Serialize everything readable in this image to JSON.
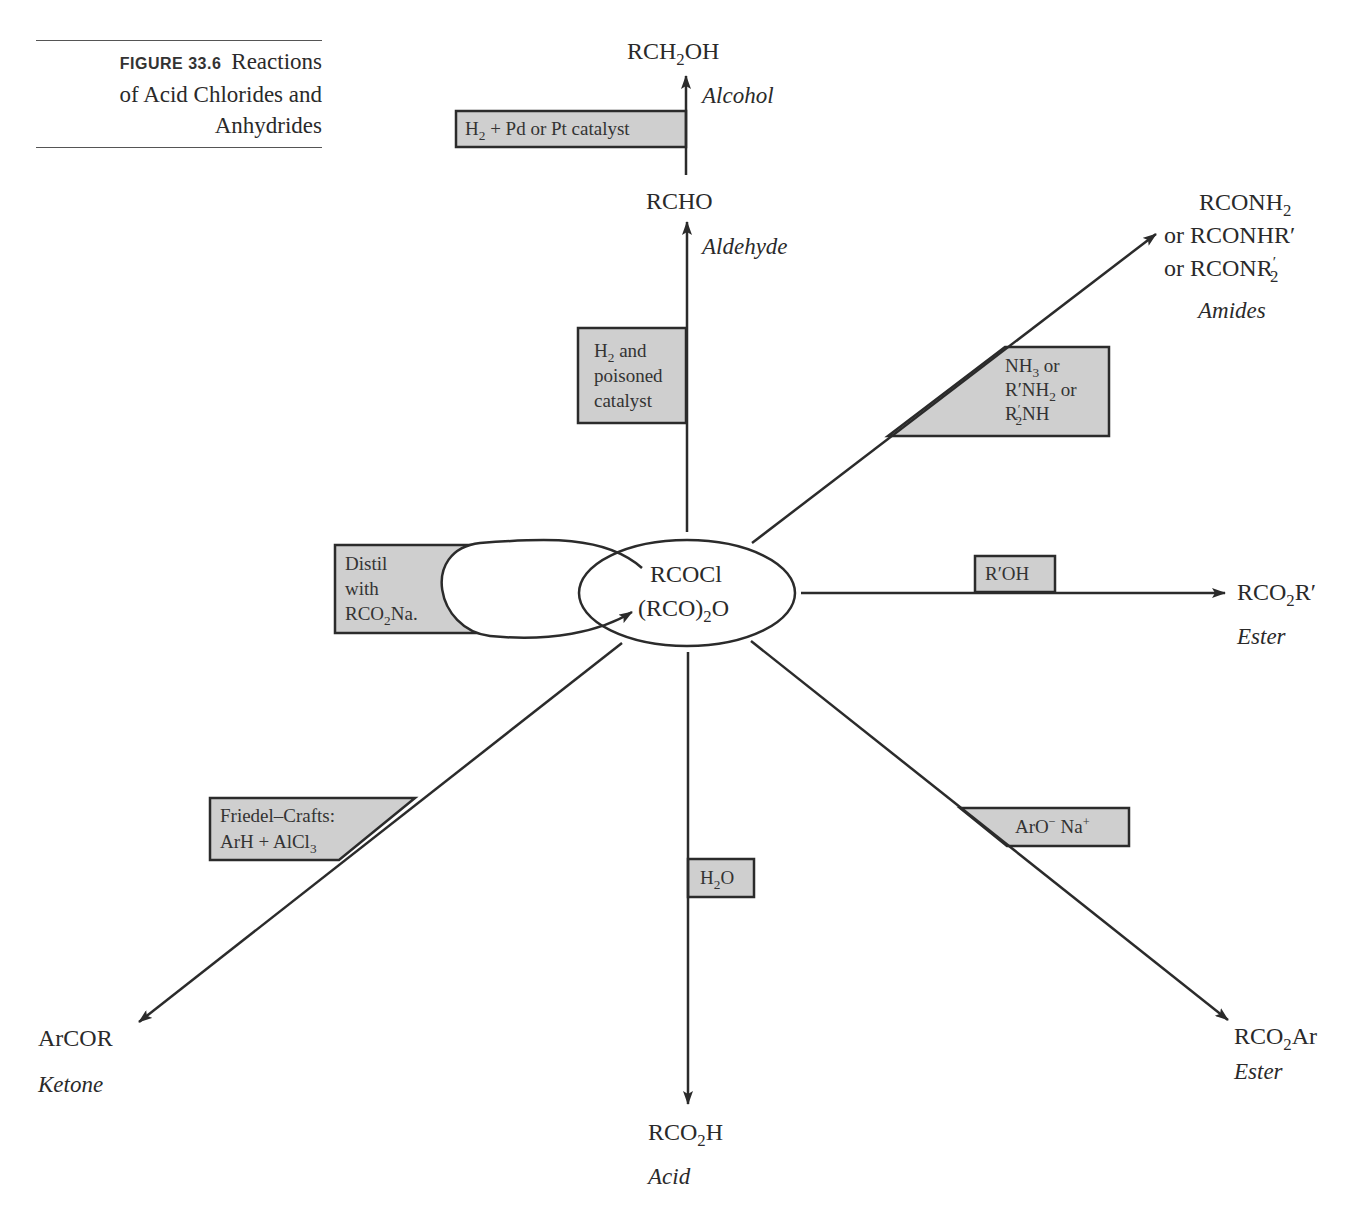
{
  "page": {
    "number_fragment": "787"
  },
  "caption": {
    "figure_label": "FIGURE 33.6",
    "title_line1": "Reactions",
    "title_line2": "of Acid Chlorides and",
    "title_line3": "Anhydrides"
  },
  "center": {
    "line1": "RCOCl",
    "line2_pre": "(RCO)",
    "line2_sub": "2",
    "line2_post": "O"
  },
  "products": {
    "alcohol": {
      "formula_pre": "RCH",
      "formula_sub": "2",
      "formula_post": "OH",
      "name": "Alcohol"
    },
    "aldehyde": {
      "formula": "RCHO",
      "name": "Aldehyde"
    },
    "amides": {
      "line1_pre": "RCONH",
      "line1_sub": "2",
      "line2": "or RCONHR′",
      "line3_pre": "or RCONR",
      "line3_sup": "′",
      "line3_sub": "2",
      "name": "Amides"
    },
    "ester_alkyl": {
      "formula_pre": "RCO",
      "formula_sub": "2",
      "formula_post": "R′",
      "name": "Ester"
    },
    "ester_aryl": {
      "formula_pre": "RCO",
      "formula_sub": "2",
      "formula_post": "Ar",
      "name": "Ester"
    },
    "acid": {
      "formula_pre": "RCO",
      "formula_sub": "2",
      "formula_post": "H",
      "name": "Acid"
    },
    "ketone": {
      "formula": "ArCOR",
      "name": "Ketone"
    }
  },
  "reagents": {
    "hydrogenation": {
      "pre": "H",
      "sub": "2",
      "post": " + Pd or Pt catalyst"
    },
    "rosenmund": {
      "line1_pre": "H",
      "line1_sub": "2",
      "line1_post": " and",
      "line2": "poisoned",
      "line3": "catalyst"
    },
    "amine": {
      "line1_pre": "NH",
      "line1_sub": "3",
      "line1_post": " or",
      "line2_pre": "R′NH",
      "line2_sub": "2",
      "line2_post": " or",
      "line3_pre": "R",
      "line3_sup": "′",
      "line3_sub": "2",
      "line3_post": "NH"
    },
    "alcohol": {
      "label": "R′OH"
    },
    "phenoxide": {
      "pre": "ArO",
      "sup1": "−",
      "mid": " Na",
      "sup2": "+"
    },
    "water": {
      "pre": "H",
      "sub": "2",
      "post": "O"
    },
    "friedel_crafts": {
      "line1": "Friedel–Crafts:",
      "line2_pre": "ArH + AlCl",
      "line2_sub": "3"
    },
    "distil": {
      "line1": "Distil",
      "line2": "with",
      "line3_pre": "RCO",
      "line3_sub": "2",
      "line3_post": "Na."
    }
  },
  "colors": {
    "box_fill": "#cfcfcf",
    "line": "#2b2b2b",
    "text": "#2a2a2a"
  }
}
